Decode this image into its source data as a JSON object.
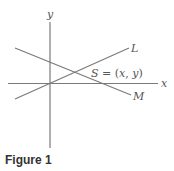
{
  "figure": {
    "caption": "Figure 1",
    "axes": {
      "x_label": "x",
      "y_label": "y"
    },
    "lines": [
      {
        "name": "L",
        "label": "L"
      },
      {
        "name": "M",
        "label": "M"
      }
    ],
    "intersection": {
      "label_S": "S",
      "label_eq": " = (",
      "label_x": "x",
      "label_comma": ", ",
      "label_y": "y",
      "label_close": ")"
    },
    "colors": {
      "line": "#7a7a7a",
      "text": "#555555",
      "caption": "#333333"
    }
  }
}
